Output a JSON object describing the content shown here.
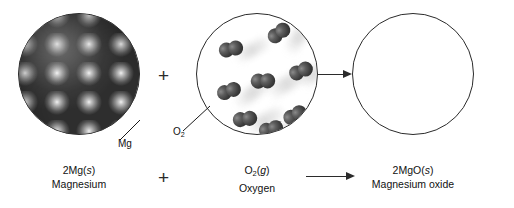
{
  "figure": {
    "background_color": "#ffffff",
    "line_color": "#2b2b2b"
  },
  "operators": {
    "plus_top": "+",
    "plus_bottom": "+",
    "arrow_top": "→",
    "arrow_bottom": "→"
  },
  "panels": [
    {
      "id": "reactant-magnesium",
      "representation": "close-packed gray metal spheres filling the circle",
      "callout": {
        "label": "Mg",
        "label_plain": "Mg"
      },
      "caption": {
        "formula_prefix": "2Mg(",
        "formula_state": "s",
        "formula_suffix": ")",
        "formula_plain": "2Mg(s)",
        "name": "Magnesium"
      }
    },
    {
      "id": "reactant-oxygen",
      "representation": "diatomic O2 molecules with motion-blur streaks on a white field",
      "molecule_count": 8,
      "callout": {
        "label_base": "O",
        "label_sub": "2",
        "label_plain": "O2"
      },
      "caption": {
        "formula_base": "O",
        "formula_sub": "2",
        "formula_prefix": "(",
        "formula_state": "g",
        "formula_suffix": ")",
        "formula_plain": "O2(g)",
        "name": "Oxygen"
      }
    },
    {
      "id": "product-magnesium-oxide",
      "representation": "empty circle outline",
      "caption": {
        "formula_prefix": "2MgO(",
        "formula_state": "s",
        "formula_suffix": ")",
        "formula_plain": "2MgO(s)",
        "name": "Magnesium oxide"
      }
    }
  ],
  "molecules": [
    {
      "x": 20,
      "y": 68,
      "rot": -38,
      "streak_x": 34,
      "streak_y": 72,
      "streak_w": 44,
      "streak_h": 13,
      "streak_rot": -38
    },
    {
      "x": 22,
      "y": 26,
      "rot": -30,
      "streak_x": 36,
      "streak_y": 30,
      "streak_w": 38,
      "streak_h": 12,
      "streak_rot": -30
    },
    {
      "x": 70,
      "y": 10,
      "rot": -55,
      "streak_x": 82,
      "streak_y": 16,
      "streak_w": 40,
      "streak_h": 13,
      "streak_rot": -58
    },
    {
      "x": 54,
      "y": 58,
      "rot": -20,
      "streak_x": 68,
      "streak_y": 62,
      "streak_w": 46,
      "streak_h": 14,
      "streak_rot": -32
    },
    {
      "x": 92,
      "y": 48,
      "rot": -42,
      "streak_x": 100,
      "streak_y": 54,
      "streak_w": 34,
      "streak_h": 12,
      "streak_rot": -46
    },
    {
      "x": 36,
      "y": 96,
      "rot": -26,
      "streak_x": 48,
      "streak_y": 100,
      "streak_w": 40,
      "streak_h": 13,
      "streak_rot": -30
    },
    {
      "x": 86,
      "y": 92,
      "rot": -48,
      "streak_x": 96,
      "streak_y": 96,
      "streak_w": 34,
      "streak_h": 12,
      "streak_rot": -50
    },
    {
      "x": 62,
      "y": 106,
      "rot": -34,
      "streak_x": 74,
      "streak_y": 110,
      "streak_w": 32,
      "streak_h": 12,
      "streak_rot": -36
    }
  ]
}
